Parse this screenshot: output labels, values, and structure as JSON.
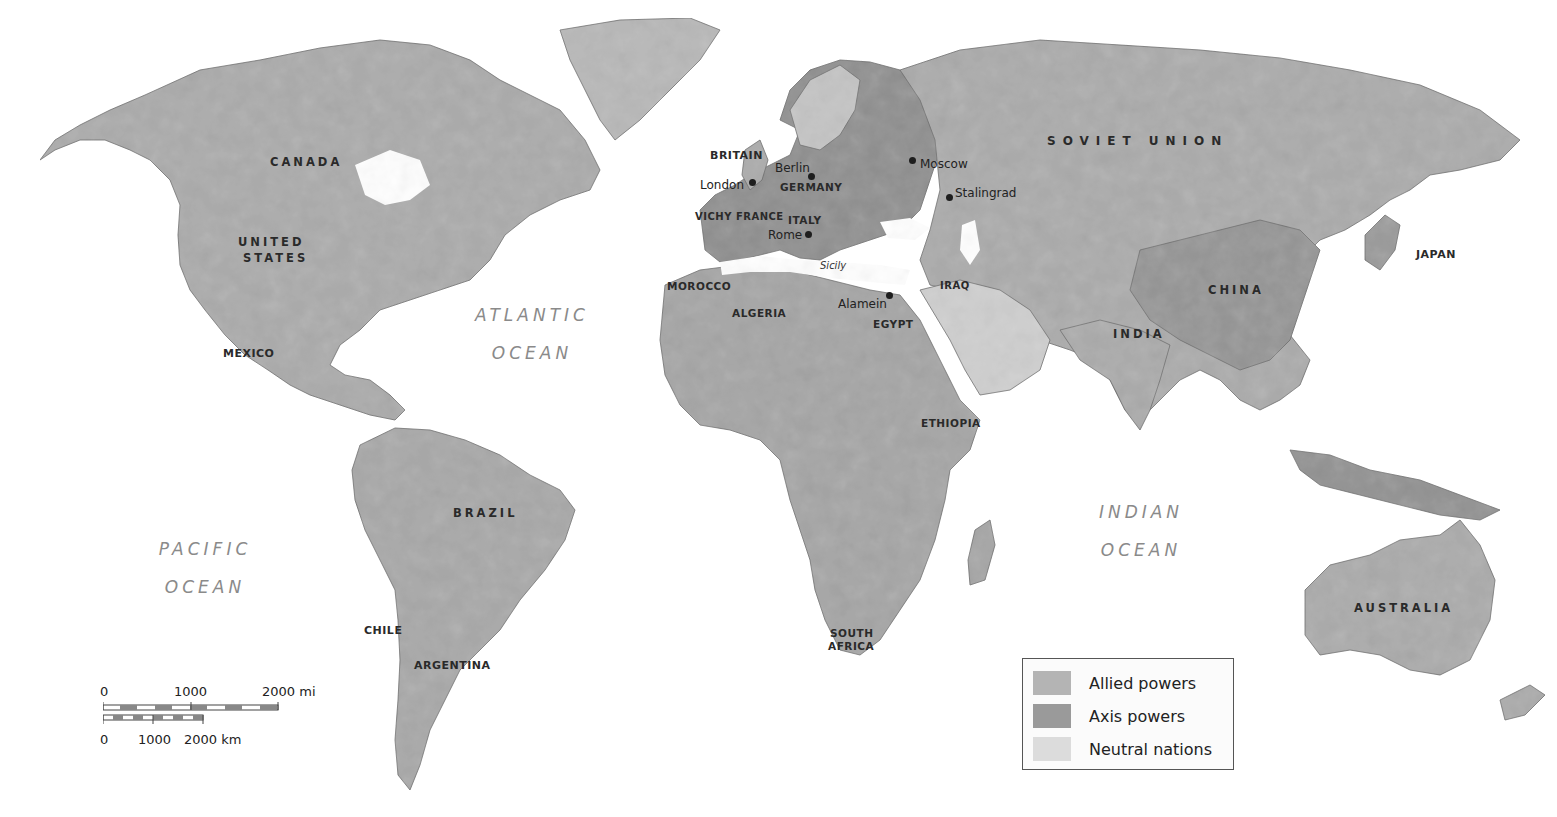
{
  "map": {
    "title": "World War II alliances",
    "colors": {
      "ocean": "#ffffff",
      "allied": "#ababab",
      "axis": "#8f8f8f",
      "neutral": "#d6d6d6",
      "border": "#5a5a5a",
      "label": "#2a2a2a",
      "ocean_label": "#8a8a8a"
    }
  },
  "oceans": {
    "atlantic": {
      "line1": "ATLANTIC",
      "line2": "OCEAN"
    },
    "pacific": {
      "line1": "PACIFIC",
      "line2": "OCEAN"
    },
    "indian": {
      "line1": "INDIAN",
      "line2": "OCEAN"
    }
  },
  "countries": {
    "canada": "CANADA",
    "us_line1": "UNITED",
    "us_line2": "STATES",
    "mexico": "MEXICO",
    "brazil": "BRAZIL",
    "chile": "CHILE",
    "argentina": "ARGENTINA",
    "britain": "BRITAIN",
    "germany": "GERMANY",
    "vichy_france": "VICHY FRANCE",
    "italy": "ITALY",
    "morocco": "MOROCCO",
    "algeria": "ALGERIA",
    "egypt": "EGYPT",
    "iraq": "IRAQ",
    "ethiopia": "ETHIOPIA",
    "south_africa_line1": "SOUTH",
    "south_africa_line2": "AFRICA",
    "soviet_union": "SOVIET UNION",
    "india": "INDIA",
    "china": "CHINA",
    "japan": "JAPAN",
    "australia": "AUSTRALIA"
  },
  "cities": {
    "london": "London",
    "berlin": "Berlin",
    "rome": "Rome",
    "moscow": "Moscow",
    "stalingrad": "Stalingrad",
    "alamein": "Alamein"
  },
  "features": {
    "sicily": "Sicily"
  },
  "legend": {
    "items": [
      {
        "label": "Allied powers",
        "color": "#b4b4b4"
      },
      {
        "label": "Axis powers",
        "color": "#9a9a9a"
      },
      {
        "label": "Neutral nations",
        "color": "#dcdcdc"
      }
    ]
  },
  "scale_bar": {
    "miles": {
      "ticks": [
        "0",
        "1000",
        "2000 mi"
      ]
    },
    "km": {
      "ticks": [
        "0",
        "1000",
        "2000 km"
      ]
    }
  }
}
